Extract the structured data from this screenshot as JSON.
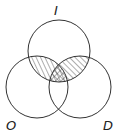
{
  "diagram": {
    "type": "venn",
    "sets": [
      {
        "id": "I",
        "label": "I",
        "cx": 59,
        "cy": 51,
        "r": 31
      },
      {
        "id": "O",
        "label": "O",
        "cx": 37,
        "cy": 87,
        "r": 31
      },
      {
        "id": "D",
        "label": "D",
        "cx": 80,
        "cy": 87,
        "r": 31
      }
    ],
    "shaded_regions": [
      {
        "region": "I∩O",
        "pattern": "steep diagonal hatch"
      },
      {
        "region": "I∩D",
        "pattern": "45° diagonal hatch"
      },
      {
        "region": "I∩O∩D",
        "pattern": "crosshatch"
      }
    ],
    "colors": {
      "stroke": "#333333",
      "background": "#ffffff"
    }
  }
}
